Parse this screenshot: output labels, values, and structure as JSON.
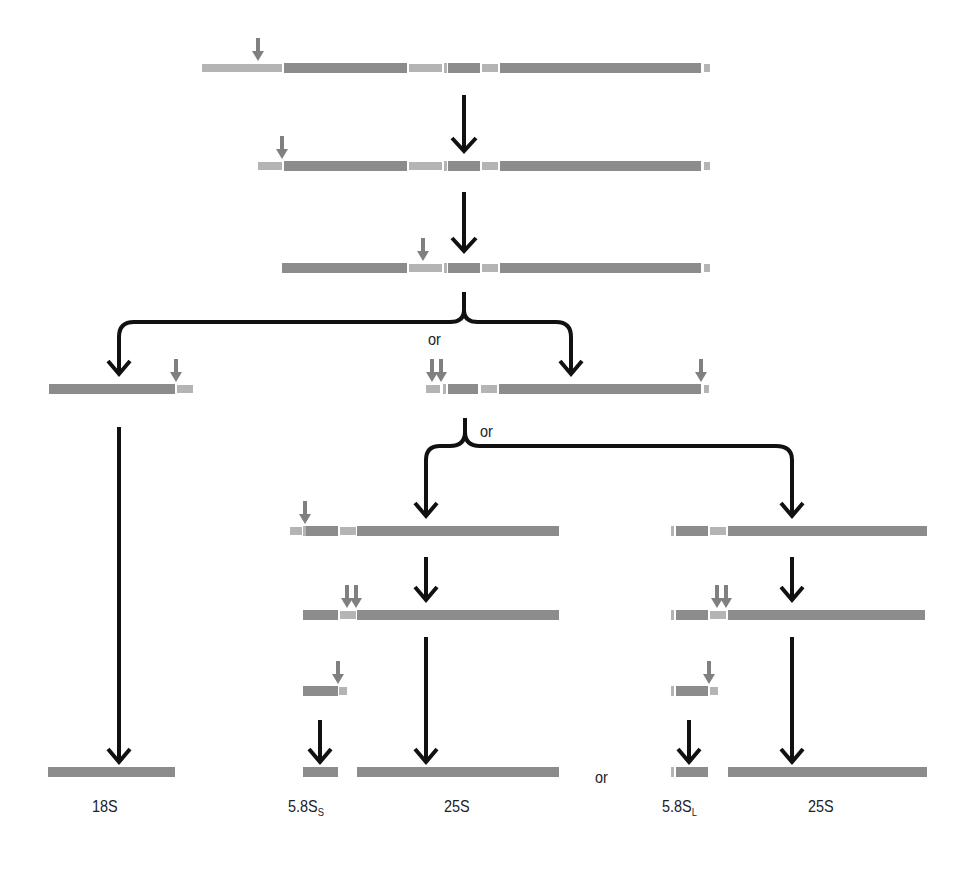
{
  "diagram": {
    "type": "rRNA processing pathway",
    "colors": {
      "mature_segment": "#8c8c8c",
      "spacer_segment": "#b4b4b4",
      "process_arrow": "#111111",
      "cleavage_arrow": "#808080"
    },
    "labels": {
      "or_1": "or",
      "or_2": "or",
      "or_3": "or",
      "final_18S": "18S",
      "final_58Ss_base": "5.8S",
      "final_58Ss_sub": "S",
      "final_25S_a": "25S",
      "final_58SL_base": "5.8S",
      "final_58SL_sub": "L",
      "final_25S_b": "25S"
    },
    "rows": [
      {
        "name": "primary-transcript",
        "y": 68,
        "segments": [
          {
            "x": 202,
            "w": 80,
            "k": "spacer"
          },
          {
            "x": 284,
            "w": 123,
            "k": "mature"
          },
          {
            "x": 409,
            "w": 33,
            "k": "spacer"
          },
          {
            "x": 444,
            "w": 3,
            "k": "tick"
          },
          {
            "x": 448,
            "w": 32,
            "k": "mature"
          },
          {
            "x": 482,
            "w": 16,
            "k": "spacer"
          },
          {
            "x": 500,
            "w": 201,
            "k": "mature"
          },
          {
            "x": 704,
            "w": 6,
            "k": "spacer"
          }
        ],
        "cleavage": [
          258
        ]
      },
      {
        "name": "intermediate-1",
        "y": 166,
        "segments": [
          {
            "x": 258,
            "w": 24,
            "k": "spacer"
          },
          {
            "x": 284,
            "w": 123,
            "k": "mature"
          },
          {
            "x": 409,
            "w": 33,
            "k": "spacer"
          },
          {
            "x": 444,
            "w": 3,
            "k": "tick"
          },
          {
            "x": 448,
            "w": 32,
            "k": "mature"
          },
          {
            "x": 482,
            "w": 16,
            "k": "spacer"
          },
          {
            "x": 500,
            "w": 201,
            "k": "mature"
          },
          {
            "x": 704,
            "w": 6,
            "k": "spacer"
          }
        ],
        "cleavage": [
          282
        ]
      },
      {
        "name": "intermediate-2",
        "y": 268,
        "segments": [
          {
            "x": 282,
            "w": 125,
            "k": "mature"
          },
          {
            "x": 409,
            "w": 33,
            "k": "spacer"
          },
          {
            "x": 444,
            "w": 3,
            "k": "tick"
          },
          {
            "x": 448,
            "w": 32,
            "k": "mature"
          },
          {
            "x": 482,
            "w": 16,
            "k": "spacer"
          },
          {
            "x": 500,
            "w": 201,
            "k": "mature"
          },
          {
            "x": 704,
            "w": 6,
            "k": "spacer"
          }
        ],
        "cleavage": [
          423
        ]
      },
      {
        "name": "pre-18S",
        "y": 389,
        "segments": [
          {
            "x": 49,
            "w": 126,
            "k": "mature"
          },
          {
            "x": 177,
            "w": 16,
            "k": "spacer"
          }
        ],
        "cleavage": [
          176
        ]
      },
      {
        "name": "pre-5.8S-25S",
        "y": 389,
        "segments": [
          {
            "x": 426,
            "w": 14,
            "k": "spacer"
          },
          {
            "x": 443,
            "w": 3,
            "k": "tick"
          },
          {
            "x": 448,
            "w": 30,
            "k": "mature"
          },
          {
            "x": 481,
            "w": 16,
            "k": "spacer"
          },
          {
            "x": 499,
            "w": 202,
            "k": "mature"
          },
          {
            "x": 704,
            "w": 5,
            "k": "spacer"
          }
        ],
        "cleavage": [
          432,
          441,
          701
        ]
      },
      {
        "name": "left-branch-1",
        "y": 531,
        "segments": [
          {
            "x": 290,
            "w": 12,
            "k": "spacer"
          },
          {
            "x": 303,
            "w": 3,
            "k": "tick"
          },
          {
            "x": 306,
            "w": 32,
            "k": "mature"
          },
          {
            "x": 340,
            "w": 16,
            "k": "spacer"
          },
          {
            "x": 357,
            "w": 202,
            "k": "mature"
          }
        ],
        "cleavage": [
          305
        ]
      },
      {
        "name": "right-branch-1",
        "y": 531,
        "segments": [
          {
            "x": 671,
            "w": 3,
            "k": "tick"
          },
          {
            "x": 676,
            "w": 32,
            "k": "mature"
          },
          {
            "x": 710,
            "w": 16,
            "k": "spacer"
          },
          {
            "x": 728,
            "w": 199,
            "k": "mature"
          }
        ],
        "cleavage": []
      },
      {
        "name": "left-branch-2",
        "y": 615,
        "segments": [
          {
            "x": 303,
            "w": 35,
            "k": "mature"
          },
          {
            "x": 340,
            "w": 16,
            "k": "spacer"
          },
          {
            "x": 357,
            "w": 202,
            "k": "mature"
          }
        ],
        "cleavage": [
          347,
          356
        ]
      },
      {
        "name": "right-branch-2",
        "y": 615,
        "segments": [
          {
            "x": 671,
            "w": 3,
            "k": "tick"
          },
          {
            "x": 676,
            "w": 32,
            "k": "mature"
          },
          {
            "x": 710,
            "w": 16,
            "k": "spacer"
          },
          {
            "x": 728,
            "w": 197,
            "k": "mature"
          }
        ],
        "cleavage": [
          717,
          726
        ]
      },
      {
        "name": "left-5.8S-precursor",
        "y": 691,
        "segments": [
          {
            "x": 303,
            "w": 35,
            "k": "mature"
          },
          {
            "x": 339,
            "w": 8,
            "k": "spacer"
          }
        ],
        "cleavage": [
          338
        ]
      },
      {
        "name": "right-5.8S-precursor",
        "y": 691,
        "segments": [
          {
            "x": 671,
            "w": 3,
            "k": "tick"
          },
          {
            "x": 676,
            "w": 32,
            "k": "mature"
          },
          {
            "x": 710,
            "w": 8,
            "k": "spacer"
          }
        ],
        "cleavage": [
          709
        ]
      },
      {
        "name": "final-18S",
        "y": 772,
        "segments": [
          {
            "x": 48,
            "w": 127,
            "k": "mature"
          }
        ],
        "cleavage": []
      },
      {
        "name": "final-5.8Ss",
        "y": 772,
        "segments": [
          {
            "x": 303,
            "w": 35,
            "k": "mature"
          }
        ],
        "cleavage": []
      },
      {
        "name": "final-25S-a",
        "y": 772,
        "segments": [
          {
            "x": 357,
            "w": 202,
            "k": "mature"
          }
        ],
        "cleavage": []
      },
      {
        "name": "final-5.8SL",
        "y": 772,
        "segments": [
          {
            "x": 671,
            "w": 3,
            "k": "tick"
          },
          {
            "x": 676,
            "w": 32,
            "k": "mature"
          }
        ],
        "cleavage": []
      },
      {
        "name": "final-25S-b",
        "y": 772,
        "segments": [
          {
            "x": 728,
            "w": 199,
            "k": "mature"
          }
        ],
        "cleavage": []
      }
    ]
  }
}
